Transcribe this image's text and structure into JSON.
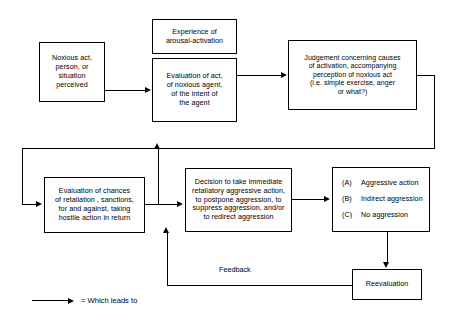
{
  "diagram": {
    "accent_color": "#000000",
    "background_color": "#ffffff",
    "nodes": {
      "noxious": "Noxious act,\nperson, or\nsituation\nperceived",
      "experience": "Experience of\narousal-activation",
      "evaluation_act": "Evaluation of act,\nof noxious agent,\nof the intent of\nthe agent",
      "judgement": "Judgement concerning causes\nof activation, accompanying\nperception of noxious act\n(i.e. simple exercise, anger\nor what?)",
      "chances": "Evaluation of chances\nof retaliation , sanctions,\nfor and against, taking\nhostile action in return",
      "decision": "Decision to take immediate\nretaliatory aggressive action,\nto postpone aggression, to\nsuppress aggression, and/or\nto redirect aggression",
      "reevaluation": "Reevaluation"
    },
    "outcomes": [
      {
        "key": "(A)",
        "label": "Aggressive action"
      },
      {
        "key": "(B)",
        "label": "Indirect aggression"
      },
      {
        "key": "(C)",
        "label": "No aggression"
      }
    ],
    "labels": {
      "feedback": "Feedback"
    },
    "legend": {
      "symbol": "arrow-right-icon",
      "text": "= Which leads to"
    }
  }
}
